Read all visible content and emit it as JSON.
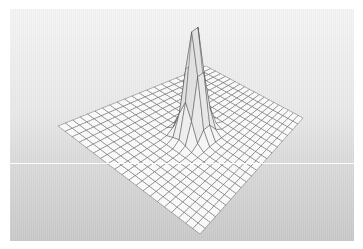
{
  "figure": {
    "type": "3d-surface-mesh-plot",
    "title": "",
    "render_style": "wireframe-mesh",
    "colors": {
      "page_border": "#ffffff",
      "background_top": "#f2f2f2",
      "background_bottom": "#cfcfcf",
      "mesh_line": "#3c3c3c",
      "mesh_face_low": "#fbfbfb",
      "mesh_face_high": "#d7d7d7",
      "peak_shadow": "#8d8d8d",
      "scanline": "#ffffff"
    },
    "artifacts": {
      "scanline_label": "horizontal white scan artifact",
      "scanline_y": 154,
      "texture_label": "vertical scan banding"
    }
  },
  "chart_data": {
    "type": "surface",
    "title": "",
    "subtitle": "",
    "xlabel": "",
    "ylabel": "",
    "zlabel": "",
    "function": "gaussian",
    "grid_n_x": 21,
    "grid_n_y": 21,
    "xlim": [
      -1,
      1
    ],
    "ylim": [
      -1,
      1
    ],
    "zlim": [
      0,
      1
    ],
    "peak": {
      "x": 0.05,
      "y": 0.0,
      "z": 1.0,
      "sigma": 0.1,
      "amplitude": 1.0
    },
    "baseline_z": 0.0,
    "grid": true,
    "legend": null,
    "axes_visible": false,
    "tick_labels": [],
    "annotations": [],
    "projection": {
      "style": "isometric",
      "corner_left_px": [
        48,
        117
      ],
      "corner_back_px": [
        196,
        57
      ],
      "corner_right_px": [
        293,
        109
      ],
      "corner_front_px": [
        190,
        225
      ]
    }
  }
}
